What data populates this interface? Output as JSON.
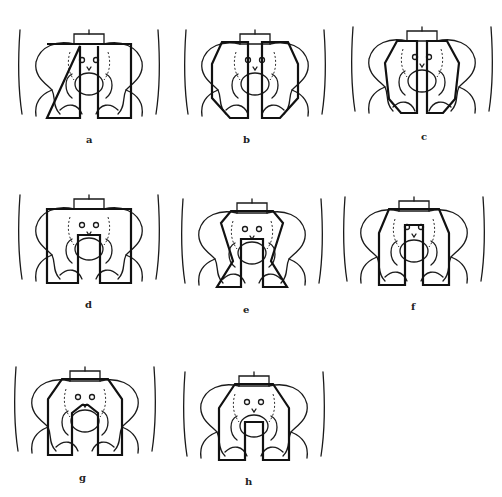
{
  "figure": {
    "panels": [
      {
        "id": "a",
        "label": "a",
        "field": "box"
      },
      {
        "id": "b",
        "label": "b",
        "field": "split-oblique"
      },
      {
        "id": "c",
        "label": "c",
        "field": "split-oblique-narrow"
      },
      {
        "id": "d",
        "label": "d",
        "field": "box-central-block"
      },
      {
        "id": "e",
        "label": "e",
        "field": "octagon-central-block"
      },
      {
        "id": "f",
        "label": "f",
        "field": "trapezoid-central-block"
      },
      {
        "id": "g",
        "label": "g",
        "field": "octagon-split"
      },
      {
        "id": "h",
        "label": "h",
        "field": "octagon-central-block-wide"
      }
    ],
    "caption": ""
  },
  "colors": {
    "line": "#1a1a1a",
    "field": "#111111",
    "background": "#ffffff"
  }
}
